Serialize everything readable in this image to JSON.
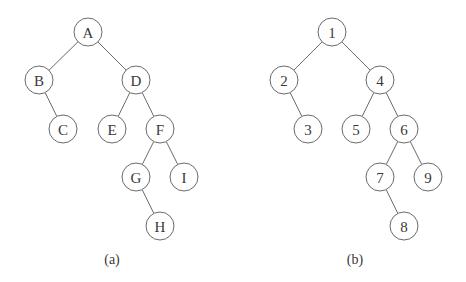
{
  "figure": {
    "node_radius": 14,
    "colors": {
      "stroke": "#6a6a6a",
      "text": "#3a3a3a",
      "background": "#ffffff"
    },
    "trees": [
      {
        "id": "a",
        "caption": "(a)",
        "caption_pos": [
          112,
          259
        ],
        "nodes": [
          {
            "id": "A",
            "label": "A",
            "x": 88,
            "y": 32
          },
          {
            "id": "B",
            "label": "B",
            "x": 39,
            "y": 80
          },
          {
            "id": "D",
            "label": "D",
            "x": 136,
            "y": 80
          },
          {
            "id": "C",
            "label": "C",
            "x": 63,
            "y": 129
          },
          {
            "id": "E",
            "label": "E",
            "x": 112,
            "y": 129
          },
          {
            "id": "F",
            "label": "F",
            "x": 160,
            "y": 129
          },
          {
            "id": "G",
            "label": "G",
            "x": 136,
            "y": 177
          },
          {
            "id": "I",
            "label": "I",
            "x": 184,
            "y": 177
          },
          {
            "id": "H",
            "label": "H",
            "x": 160,
            "y": 226
          }
        ],
        "edges": [
          [
            "A",
            "B"
          ],
          [
            "A",
            "D"
          ],
          [
            "B",
            "C"
          ],
          [
            "D",
            "E"
          ],
          [
            "D",
            "F"
          ],
          [
            "F",
            "G"
          ],
          [
            "F",
            "I"
          ],
          [
            "G",
            "H"
          ]
        ]
      },
      {
        "id": "b",
        "caption": "(b)",
        "caption_pos": [
          355,
          259
        ],
        "nodes": [
          {
            "id": "1",
            "label": "1",
            "x": 332,
            "y": 32
          },
          {
            "id": "2",
            "label": "2",
            "x": 284,
            "y": 80
          },
          {
            "id": "4",
            "label": "4",
            "x": 380,
            "y": 80
          },
          {
            "id": "3",
            "label": "3",
            "x": 308,
            "y": 129
          },
          {
            "id": "5",
            "label": "5",
            "x": 356,
            "y": 129
          },
          {
            "id": "6",
            "label": "6",
            "x": 404,
            "y": 129
          },
          {
            "id": "7",
            "label": "7",
            "x": 380,
            "y": 177
          },
          {
            "id": "9",
            "label": "9",
            "x": 428,
            "y": 177
          },
          {
            "id": "8",
            "label": "8",
            "x": 404,
            "y": 226
          }
        ],
        "edges": [
          [
            "1",
            "2"
          ],
          [
            "1",
            "4"
          ],
          [
            "2",
            "3"
          ],
          [
            "4",
            "5"
          ],
          [
            "4",
            "6"
          ],
          [
            "6",
            "7"
          ],
          [
            "6",
            "9"
          ],
          [
            "7",
            "8"
          ]
        ]
      }
    ]
  }
}
